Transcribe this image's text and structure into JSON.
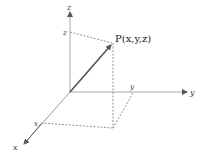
{
  "diagram": {
    "axes": {
      "x": {
        "label": "x",
        "tick_label": "x"
      },
      "y": {
        "label": "y",
        "tick_label": "y"
      },
      "z": {
        "label": "z",
        "tick_label": "z"
      }
    },
    "point": {
      "label": "P(x,y,z)",
      "name": "P",
      "coords_text": "(x,y,z)"
    },
    "colors": {
      "axis": "#9a9a9a",
      "vector": "#555555",
      "dashed": "#777777",
      "text": "#333333"
    }
  }
}
